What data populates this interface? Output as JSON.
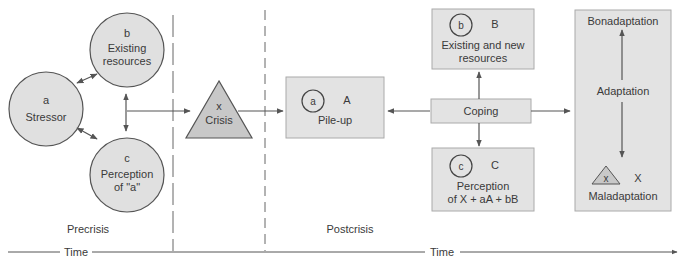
{
  "diagram": {
    "type": "Double ABCX model of family stress and adaptation",
    "colors": {
      "node_fill": "#e0e0e0",
      "box_fill": "#e3e3e3",
      "triangle_fill": "#c8c8c8",
      "stroke": "#555555",
      "line": "#666666"
    },
    "precrisis": {
      "phase_label": "Precrisis",
      "stressor": {
        "letter": "a",
        "label": "Stressor"
      },
      "resources": {
        "letter": "b",
        "line1": "Existing",
        "line2": "resources"
      },
      "perception": {
        "letter": "c",
        "line1": "Perception",
        "line2": "of \"a\""
      },
      "crisis": {
        "letter": "x",
        "label": "Crisis"
      }
    },
    "postcrisis": {
      "phase_label": "Postcrisis",
      "pileup": {
        "circle_letter": "a",
        "capital": "A",
        "label": "Pile-up"
      },
      "resources": {
        "circle_letter": "b",
        "capital": "B",
        "line1": "Existing and new",
        "line2": "resources"
      },
      "coping": {
        "label": "Coping"
      },
      "perception": {
        "circle_letter": "c",
        "capital": "C",
        "line1": "Perception",
        "line2": "of X + aA + bB"
      },
      "adaptation": {
        "top": "Bonadaptation",
        "middle": "Adaptation",
        "bottom": "Maladaptation",
        "triangle_letter": "x",
        "capital": "X"
      }
    },
    "timeline": {
      "left_label": "Time",
      "right_label": "Time"
    }
  }
}
